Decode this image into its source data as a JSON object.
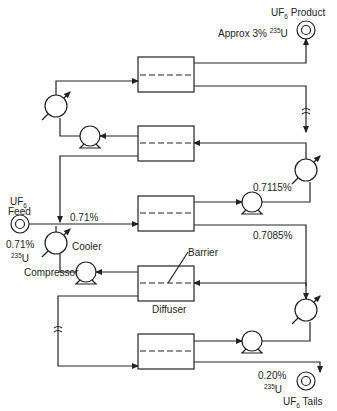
{
  "diagram": {
    "labels": {
      "product_pre": "UF",
      "product_sub": "6",
      "product_post": " Product",
      "product_assay_pre": "Approx 3% ",
      "product_assay_sup": "235",
      "product_assay_post": "U",
      "feed_pre": "UF",
      "feed_sub": "6",
      "feed_word": "Feed",
      "feed_assay": "0.71%",
      "feed_iso_sup": "235",
      "feed_iso": "U",
      "stream_071": "0.71%",
      "stream_07115": "0.7115%",
      "stream_07085": "0.7085%",
      "cooler": "Cooler",
      "compressor": "Compressor",
      "barrier": "Barrier",
      "diffuser": "Diffuser",
      "tails_assay": "0.20%",
      "tails_iso_sup": "235",
      "tails_iso": "U",
      "tails_pre": "UF",
      "tails_sub": "6",
      "tails_post": " Tails"
    },
    "components": [
      "feed",
      "product",
      "tails",
      "diffuser x5",
      "compressor x5",
      "cooler x4"
    ]
  }
}
